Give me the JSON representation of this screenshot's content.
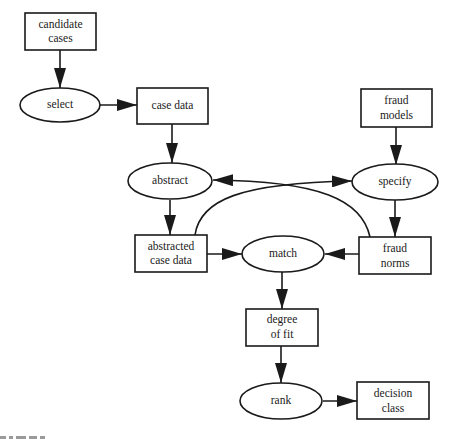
{
  "diagram": {
    "type": "flowchart",
    "colors": {
      "stroke": "#1a1a1a",
      "fill": "#ffffff",
      "text": "#1a1a1a"
    },
    "nodes": {
      "candidate_cases": {
        "shape": "rectangle",
        "line1": "candidate",
        "line2": "cases"
      },
      "select": {
        "shape": "ellipse",
        "label": "select"
      },
      "case_data": {
        "shape": "rectangle",
        "label": "case data"
      },
      "fraud_models": {
        "shape": "rectangle",
        "line1": "fraud",
        "line2": "models"
      },
      "abstract": {
        "shape": "ellipse",
        "label": "abstract"
      },
      "specify": {
        "shape": "ellipse",
        "label": "specify"
      },
      "abstracted_case_data": {
        "shape": "rectangle",
        "line1": "abstracted",
        "line2": "case data"
      },
      "match": {
        "shape": "ellipse",
        "label": "match"
      },
      "fraud_norms": {
        "shape": "rectangle",
        "line1": "fraud",
        "line2": "norms"
      },
      "degree_of_fit": {
        "shape": "rectangle",
        "line1": "degree",
        "line2": "of fit"
      },
      "rank": {
        "shape": "ellipse",
        "label": "rank"
      },
      "decision_class": {
        "shape": "rectangle",
        "line1": "decision",
        "line2": "class"
      }
    },
    "edges": [
      {
        "from": "candidate cases",
        "to": "select"
      },
      {
        "from": "select",
        "to": "case data"
      },
      {
        "from": "case data",
        "to": "abstract"
      },
      {
        "from": "fraud models",
        "to": "specify"
      },
      {
        "from": "abstract",
        "to": "abstracted case data"
      },
      {
        "from": "specify",
        "to": "fraud norms"
      },
      {
        "from": "abstracted case data",
        "to": "specify",
        "style": "curved"
      },
      {
        "from": "fraud norms",
        "to": "abstract",
        "style": "curved"
      },
      {
        "from": "abstracted case data",
        "to": "match"
      },
      {
        "from": "fraud norms",
        "to": "match"
      },
      {
        "from": "match",
        "to": "degree of fit"
      },
      {
        "from": "degree of fit",
        "to": "rank"
      },
      {
        "from": "rank",
        "to": "decision class"
      }
    ]
  }
}
